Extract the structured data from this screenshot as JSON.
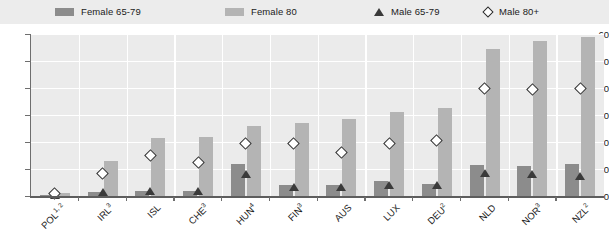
{
  "legend": {
    "items": [
      {
        "label": "Female 65-79",
        "icon": "square-swatch-dark",
        "color": "#8c8c8c"
      },
      {
        "label": "Female 80",
        "icon": "square-swatch-light",
        "color": "#b4b4b4"
      },
      {
        "label": "Male 65-79",
        "icon": "triangle-marker",
        "color": "#3a3a3a"
      },
      {
        "label": "Male 80+",
        "icon": "diamond-marker",
        "color": "#ffffff"
      }
    ]
  },
  "chart_data": {
    "type": "bar",
    "title": "",
    "subtitle": "",
    "xlabel": "",
    "ylabel": "",
    "ylim": [
      0,
      60
    ],
    "yticks": [
      0,
      10,
      20,
      30,
      40,
      50,
      60
    ],
    "grid": true,
    "legend_position": "top",
    "categories": [
      "POL",
      "IRL",
      "ISL",
      "CHE",
      "HUN",
      "FIN",
      "AUS",
      "LUX",
      "DEU",
      "NLD",
      "NOR",
      "NZL"
    ],
    "category_footnotes": [
      "1, 2",
      "3",
      "",
      "3",
      "4",
      "3",
      "",
      "",
      "2",
      "",
      "3",
      "2"
    ],
    "series": [
      {
        "name": "Female 65-79",
        "type": "bar",
        "color": "#8c8c8c",
        "values": [
          0.5,
          1.5,
          2,
          2,
          12,
          4,
          4,
          5.5,
          4.5,
          11.5,
          11,
          12
        ]
      },
      {
        "name": "Female 80",
        "type": "bar",
        "color": "#b4b4b4",
        "values": [
          1,
          13,
          21.5,
          22,
          26,
          27,
          28.5,
          31,
          32.5,
          54.5,
          57.5,
          59
        ]
      },
      {
        "name": "Male 65-79",
        "type": "marker-triangle",
        "color": "#3a3a3a",
        "values": [
          0.3,
          1.5,
          2,
          2,
          8,
          3.5,
          3.5,
          4,
          4,
          8.5,
          8,
          7.5
        ]
      },
      {
        "name": "Male 80+",
        "type": "marker-diamond",
        "color": "#ffffff",
        "values": [
          1,
          8.5,
          15,
          12.5,
          19.5,
          19.5,
          16,
          19.5,
          20.5,
          40,
          39.5,
          40
        ]
      }
    ]
  }
}
